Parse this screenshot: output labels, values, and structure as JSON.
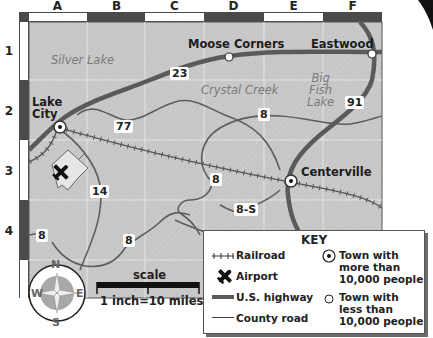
{
  "grid": {
    "columns": [
      "A",
      "B",
      "C",
      "D",
      "E",
      "F"
    ],
    "rows": [
      "1",
      "2",
      "3",
      "4"
    ]
  },
  "towns": {
    "lake_city": {
      "name_line1": "Lake",
      "name_line2": "City",
      "type": "more than 10,000"
    },
    "moose_corners": {
      "name": "Moose Corners",
      "type": "less than 10,000"
    },
    "eastwood": {
      "name": "Eastwood",
      "type": "less than 10,000"
    },
    "centerville": {
      "name": "Centerville",
      "type": "more than 10,000"
    }
  },
  "water": {
    "silver_lake": "Silver Lake",
    "crystal_creek": "Crystal Creek",
    "big_fish_lake": {
      "line1": "Big",
      "line2": "Fish",
      "line3": "Lake"
    }
  },
  "roads": {
    "us_23": "23",
    "us_91": "91",
    "county_77": "77",
    "county_14": "14",
    "county_8_north": "8",
    "county_8_mid": "8",
    "county_8_west": "8",
    "county_8_south": "8",
    "county_8s": "8-S"
  },
  "compass": {
    "n": "N",
    "s": "S",
    "e": "E",
    "w": "W"
  },
  "scale": {
    "title": "scale",
    "label": "1 inch=10 miles"
  },
  "key": {
    "title": "KEY",
    "railroad": "Railroad",
    "airport": "Airport",
    "us_highway": "U.S. highway",
    "county_road": "County road",
    "big_town": {
      "line1": "Town with",
      "line2": "more than",
      "line3": "10,000 people"
    },
    "small_town": {
      "line1": "Town with",
      "line2": "less than",
      "line3": "10,000 people"
    }
  },
  "colors": {
    "map_bg": "#c8c8c8",
    "grid_line": "#e2e2e2",
    "highway": "#5a5a5a",
    "county_road": "#5e5e5e",
    "ruler_dark": "#4a4a4a",
    "ruler_light": "#ffffff",
    "water_text": "#7a7a7a"
  }
}
